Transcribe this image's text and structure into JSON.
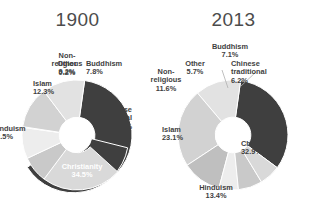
{
  "chart_data": [
    {
      "type": "pie",
      "title": "1900",
      "subtitle": "",
      "xlabel": "",
      "ylabel": "",
      "legend": "none",
      "donut": true,
      "categories": [
        "Christianity",
        "Chinese traditional",
        "Buddhism",
        "Other",
        "Non-religious",
        "Islam",
        "Hinduism"
      ],
      "values": [
        34.5,
        23.5,
        7.8,
        9.2,
        0.2,
        12.3,
        12.5
      ],
      "labels": [
        {
          "name": "Christianity",
          "pct": "34.5%"
        },
        {
          "name": "Chinese traditional",
          "pct": "23.5%"
        },
        {
          "name": "Buddhism",
          "pct": "7.8%"
        },
        {
          "name": "Other",
          "pct": "9.2%"
        },
        {
          "name": "Non-religious",
          "pct": "0.2%"
        },
        {
          "name": "Islam",
          "pct": "12.3%"
        },
        {
          "name": "Hinduism",
          "pct": "12.5%"
        }
      ],
      "colors": [
        "#3f3f3f",
        "#d9d9d9",
        "#c9c9c9",
        "#ededed",
        "#bfbfbf",
        "#d2d2d2",
        "#e2e2e2"
      ]
    },
    {
      "type": "pie",
      "title": "2013",
      "subtitle": "",
      "xlabel": "",
      "ylabel": "",
      "legend": "none",
      "donut": true,
      "categories": [
        "Christianity",
        "Chinese traditional",
        "Buddhism",
        "Other",
        "Non-religious",
        "Islam",
        "Hinduism"
      ],
      "values": [
        32.9,
        6.2,
        7.1,
        5.7,
        11.6,
        23.1,
        13.4
      ],
      "labels": [
        {
          "name": "Christianity",
          "pct": "32.9%"
        },
        {
          "name": "Chinese traditional",
          "pct": "6.2%"
        },
        {
          "name": "Buddhism",
          "pct": "7.1%"
        },
        {
          "name": "Other",
          "pct": "5.7%"
        },
        {
          "name": "Non-religious",
          "pct": "11.6%"
        },
        {
          "name": "Islam",
          "pct": "23.1%"
        },
        {
          "name": "Hinduism",
          "pct": "13.4%"
        }
      ],
      "colors": [
        "#3f3f3f",
        "#d9d9d9",
        "#c9c9c9",
        "#ededed",
        "#bfbfbf",
        "#d2d2d2",
        "#e2e2e2"
      ]
    }
  ],
  "left": {
    "title": "1900",
    "christianity_name": "Christianity",
    "christianity_pct": "34.5%",
    "chinese_name_1": "Chinese",
    "chinese_name_2": "traditional",
    "chinese_pct": "23.5%",
    "buddhism_name": "Buddhism",
    "buddhism_pct": "7.8%",
    "other_name": "Other",
    "other_pct": "9.2%",
    "nonrel_name_1": "Non-",
    "nonrel_name_2": "religious",
    "nonrel_pct": "0.2%",
    "islam_name": "Islam",
    "islam_pct": "12.3%",
    "hinduism_name": "Hinduism",
    "hinduism_pct": "12.5%"
  },
  "right": {
    "title": "2013",
    "christianity_name": "Christianity",
    "christianity_pct": "32.9%",
    "chinese_name_1": "Chinese",
    "chinese_name_2": "traditional",
    "chinese_pct": "6.2%",
    "buddhism_name": "Buddhism",
    "buddhism_pct": "7.1%",
    "other_name": "Other",
    "other_pct": "5.7%",
    "nonrel_name_1": "Non-",
    "nonrel_name_2": "religious",
    "nonrel_pct": "11.6%",
    "islam_name": "Islam",
    "islam_pct": "23.1%",
    "hinduism_name": "Hinduism",
    "hinduism_pct": "13.4%"
  }
}
